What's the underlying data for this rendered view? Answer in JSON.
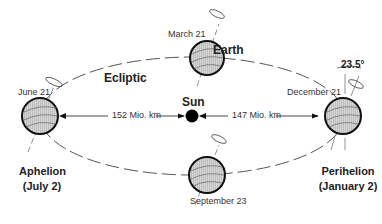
{
  "diagram": {
    "title_labels": {
      "ecliptic": "Ecliptic",
      "earth": "Earth",
      "sun": "Sun",
      "tilt_angle": "23.5°"
    },
    "positions": [
      {
        "id": "march",
        "date": "March 21"
      },
      {
        "id": "june",
        "date": "June 21"
      },
      {
        "id": "december",
        "date": "December 21"
      },
      {
        "id": "september",
        "date": "September 23"
      }
    ],
    "distances": {
      "aphelion_distance": "152 Mio. km",
      "perihelion_distance": "147 Mio. km"
    },
    "aphelion": {
      "label": "Aphelion",
      "date": "(July 2)"
    },
    "perihelion": {
      "label": "Perihelion",
      "date": "(January 2)"
    },
    "colors": {
      "globe_fill": "#c8c8c8",
      "outline": "#111111",
      "orbit": "#555555",
      "sun": "#000000"
    }
  }
}
